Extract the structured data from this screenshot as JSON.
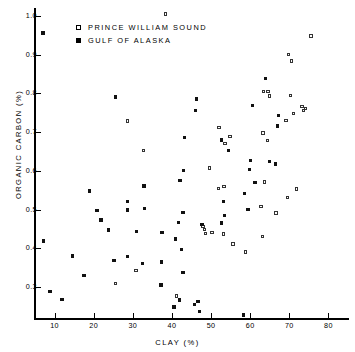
{
  "chart_data": {
    "type": "scatter",
    "title": "",
    "xlabel": "CLAY (%)",
    "ylabel": "ORGANIC CARBON (%)",
    "xlim": [
      5,
      85
    ],
    "ylim": [
      0.22,
      1.02
    ],
    "xticks": [
      10,
      20,
      30,
      40,
      50,
      60,
      70,
      80
    ],
    "xticklabels": [
      "10",
      "20",
      "30",
      "40",
      "50",
      "60",
      "70",
      "80"
    ],
    "yticks": [
      0.3,
      0.4,
      0.5,
      0.6,
      0.7,
      0.8,
      0.9,
      1.0
    ],
    "yticklabels": [
      "0.3",
      "0.4",
      "0.5",
      "0.6",
      "0.7",
      "0.8",
      "0.9",
      "1.0"
    ],
    "grid": false,
    "legend_position": "top-left",
    "series": [
      {
        "name": "PRINCE WILLIAM SOUND",
        "marker": "open-square",
        "color": "#ffffff",
        "edge_color": "#333333",
        "points": [
          [
            38.4,
            1.005
          ],
          [
            75.5,
            0.948
          ],
          [
            69.8,
            0.9
          ],
          [
            70.6,
            0.883
          ],
          [
            65.0,
            0.793
          ],
          [
            63.4,
            0.805
          ],
          [
            64.6,
            0.805
          ],
          [
            70.3,
            0.795
          ],
          [
            73.2,
            0.766
          ],
          [
            74.1,
            0.76
          ],
          [
            73.6,
            0.755
          ],
          [
            71.1,
            0.748
          ],
          [
            69.2,
            0.729
          ],
          [
            28.7,
            0.728
          ],
          [
            52.0,
            0.712
          ],
          [
            63.3,
            0.697
          ],
          [
            54.8,
            0.688
          ],
          [
            64.5,
            0.678
          ],
          [
            53.6,
            0.671
          ],
          [
            32.7,
            0.653
          ],
          [
            49.6,
            0.607
          ],
          [
            63.6,
            0.571
          ],
          [
            71.8,
            0.553
          ],
          [
            69.6,
            0.531
          ],
          [
            53.3,
            0.56
          ],
          [
            51.9,
            0.555
          ],
          [
            62.8,
            0.507
          ],
          [
            66.6,
            0.491
          ],
          [
            47.9,
            0.456
          ],
          [
            48.3,
            0.448
          ],
          [
            50.2,
            0.44
          ],
          [
            48.6,
            0.438
          ],
          [
            53.1,
            0.437
          ],
          [
            63.1,
            0.431
          ],
          [
            58.8,
            0.39
          ],
          [
            55.6,
            0.411
          ],
          [
            30.8,
            0.342
          ],
          [
            25.5,
            0.309
          ],
          [
            41.2,
            0.277
          ]
        ]
      },
      {
        "name": "GULF OF ALASKA",
        "marker": "filled-square",
        "color": "#111111",
        "edge_color": "#111111",
        "points": [
          [
            7.0,
            0.956
          ],
          [
            63.9,
            0.838
          ],
          [
            25.5,
            0.79
          ],
          [
            46.3,
            0.785
          ],
          [
            60.6,
            0.768
          ],
          [
            46.0,
            0.756
          ],
          [
            67.2,
            0.743
          ],
          [
            67.0,
            0.716
          ],
          [
            43.2,
            0.686
          ],
          [
            54.4,
            0.653
          ],
          [
            52.7,
            0.679
          ],
          [
            60.0,
            0.627
          ],
          [
            43.0,
            0.601
          ],
          [
            65.0,
            0.624
          ],
          [
            66.4,
            0.617
          ],
          [
            59.8,
            0.603
          ],
          [
            42.1,
            0.575
          ],
          [
            61.2,
            0.57
          ],
          [
            32.9,
            0.561
          ],
          [
            18.9,
            0.548
          ],
          [
            58.6,
            0.541
          ],
          [
            28.7,
            0.52
          ],
          [
            53.1,
            0.521
          ],
          [
            33.0,
            0.502
          ],
          [
            20.8,
            0.498
          ],
          [
            28.6,
            0.499
          ],
          [
            59.4,
            0.5
          ],
          [
            53.4,
            0.484
          ],
          [
            42.8,
            0.493
          ],
          [
            41.6,
            0.467
          ],
          [
            52.6,
            0.465
          ],
          [
            21.9,
            0.473
          ],
          [
            47.7,
            0.462
          ],
          [
            30.9,
            0.444
          ],
          [
            37.5,
            0.44
          ],
          [
            23.8,
            0.447
          ],
          [
            40.9,
            0.424
          ],
          [
            7.1,
            0.419
          ],
          [
            42.5,
            0.397
          ],
          [
            14.6,
            0.38
          ],
          [
            28.7,
            0.379
          ],
          [
            25.2,
            0.369
          ],
          [
            32.5,
            0.36
          ],
          [
            37.4,
            0.365
          ],
          [
            42.8,
            0.337
          ],
          [
            17.5,
            0.33
          ],
          [
            37.2,
            0.305
          ],
          [
            8.8,
            0.288
          ],
          [
            11.9,
            0.268
          ],
          [
            41.9,
            0.266
          ],
          [
            46.7,
            0.263
          ],
          [
            45.7,
            0.255
          ],
          [
            40.5,
            0.248
          ],
          [
            47.1,
            0.237
          ],
          [
            58.3,
            0.228
          ]
        ]
      }
    ]
  },
  "legend": {
    "entries": [
      {
        "label": "PRINCE WILLIAM SOUND",
        "marker": "open-square"
      },
      {
        "label": "GULF OF ALASKA",
        "marker": "filled-square"
      }
    ]
  },
  "caption_fragment": ""
}
